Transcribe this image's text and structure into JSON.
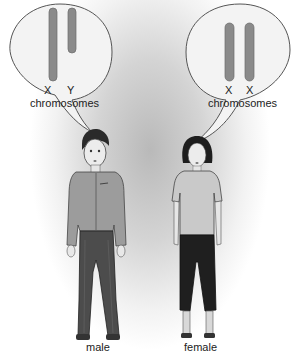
{
  "figure": {
    "left_bubble": {
      "chromosome_labels": [
        "X",
        "Y"
      ],
      "caption": "chromosomes"
    },
    "right_bubble": {
      "chromosome_labels": [
        "X",
        "X"
      ],
      "caption": "chromosomes"
    },
    "people": [
      {
        "label": "male"
      },
      {
        "label": "female"
      }
    ],
    "colors": {
      "chromosome_fill": "#8a8a8a",
      "bubble_fill": "#f3f3f3",
      "bubble_stroke": "#555555",
      "background_glow": "#b9b9b9"
    }
  }
}
